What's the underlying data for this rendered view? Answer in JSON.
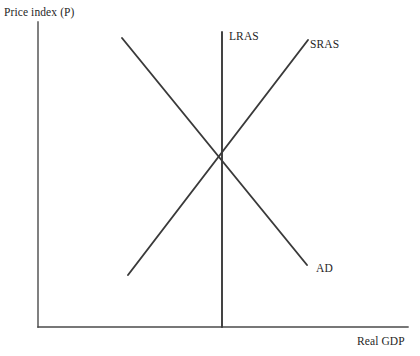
{
  "figure": {
    "background_color": "#ffffff",
    "line_color": "#3a3a3a",
    "axis_color": "#4a4a4a",
    "text_color": "#1f1f1f"
  },
  "labels": {
    "y_axis": "Price index (P)",
    "x_axis": "Real GDP",
    "lras": "LRAS",
    "sras": "SRAS",
    "ad": "AD"
  },
  "chart_data": {
    "type": "line",
    "title": "",
    "xlabel": "Real GDP",
    "ylabel": "Price index (P)",
    "grid": false,
    "legend": "inline-curve-labels",
    "axis_style": "two-sided-open (left vertical and bottom horizontal only, no ticks, no tick labels)",
    "xlim": [
      0,
      100
    ],
    "ylim": [
      0,
      100
    ],
    "annotations": [
      {
        "text": "LRAS",
        "at_pixel": [
          229,
          36
        ],
        "describes": "long-run aggregate supply, vertical line"
      },
      {
        "text": "SRAS",
        "at_pixel": [
          310,
          44
        ],
        "describes": "short-run aggregate supply, upward sloping"
      },
      {
        "text": "AD",
        "at_pixel": [
          316,
          268
        ],
        "describes": "aggregate demand, downward sloping"
      }
    ],
    "equilibrium": {
      "label": "",
      "pixel": [
        222,
        157
      ],
      "note": "AD, SRAS and LRAS all intersect at a single point (long-run equilibrium)"
    },
    "series": [
      {
        "name": "AD",
        "kind": "downward-sloping-line",
        "pixel_points": [
          [
            122,
            38
          ],
          [
            307,
            265
          ]
        ],
        "slope_sign": "negative"
      },
      {
        "name": "SRAS",
        "kind": "upward-sloping-line",
        "pixel_points": [
          [
            128,
            275
          ],
          [
            308,
            40
          ]
        ],
        "slope_sign": "positive"
      },
      {
        "name": "LRAS",
        "kind": "vertical-line",
        "pixel_points": [
          [
            222,
            32
          ],
          [
            222,
            327
          ]
        ],
        "slope_sign": "infinite"
      }
    ],
    "axes_pixels": {
      "y_axis": [
        [
          38,
          22
        ],
        [
          38,
          327
        ]
      ],
      "x_axis": [
        [
          38,
          327
        ],
        [
          408,
          327
        ]
      ]
    }
  }
}
